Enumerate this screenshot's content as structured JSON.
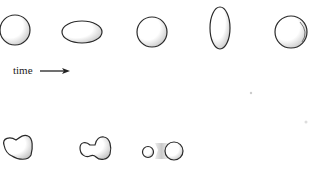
{
  "diagram": {
    "type": "droplet-sequence",
    "time_label": "time",
    "time_arrow": "right-arrow",
    "stroke_color": "#2a2a2a",
    "shading_color": "#bdbdbd",
    "rows": [
      {
        "name": "oscillating-droplet",
        "frames": [
          "sphere",
          "horizontal-oblate",
          "sphere",
          "vertical-prolate",
          "sphere"
        ]
      },
      {
        "name": "breaking-droplet",
        "frames": [
          "pear-shape",
          "necking-shape",
          "separated-droplets"
        ]
      }
    ]
  }
}
